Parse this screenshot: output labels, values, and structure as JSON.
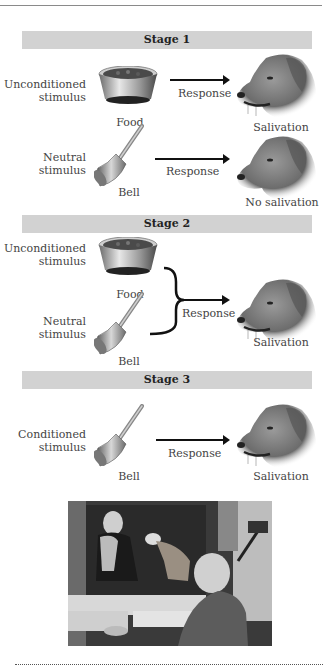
{
  "page": {
    "header_fragment": "Learning and Memory"
  },
  "stages": [
    {
      "title": "Stage 1",
      "rows": [
        {
          "stimulus_label": [
            "Unconditioned",
            "stimulus"
          ],
          "object": "Food",
          "object_icon": "food-bowl-icon",
          "response": "Response",
          "outcome": "Salivation"
        },
        {
          "stimulus_label": [
            "Neutral",
            "stimulus"
          ],
          "object": "Bell",
          "object_icon": "bell-icon",
          "response": "Response",
          "outcome": "No salivation"
        }
      ]
    },
    {
      "title": "Stage 2",
      "rows": [
        {
          "stimulus_label": [
            "Unconditioned",
            "stimulus"
          ],
          "object": "Food",
          "object_icon": "food-bowl-icon"
        },
        {
          "stimulus_label": [
            "Neutral",
            "stimulus"
          ],
          "object": "Bell",
          "object_icon": "bell-icon"
        }
      ],
      "response": "Response",
      "outcome": "Salivation"
    },
    {
      "title": "Stage 3",
      "rows": [
        {
          "stimulus_label": [
            "Conditioned",
            "stimulus"
          ],
          "object": "Bell",
          "object_icon": "bell-icon",
          "response": "Response",
          "outcome": "Salivation"
        }
      ]
    }
  ],
  "photo": {
    "description": "Historical black-and-white photo of Pavlov's laboratory with a dog on a stand and researchers"
  },
  "colors": {
    "stage_band": "#d2d2d2",
    "arrow": "#111111",
    "text": "#444444"
  }
}
